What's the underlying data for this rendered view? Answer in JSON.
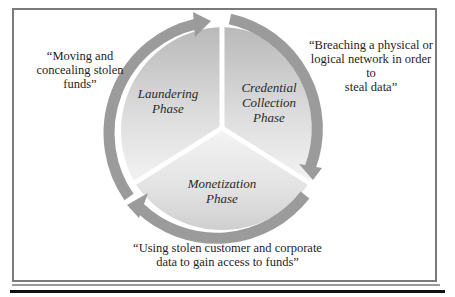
{
  "diagram": {
    "type": "cycle",
    "phases": [
      {
        "label": "Laundering Phase",
        "line1": "Laundering",
        "line2": "Phase",
        "description": "“Moving and concealing stolen funds”",
        "desc_lines": [
          "“Moving and",
          "concealing stolen",
          "funds”"
        ]
      },
      {
        "label": "Credential Collection Phase",
        "line1": "Credential",
        "line2": "Collection",
        "line3": "Phase",
        "description": "“Breaching a physical or logical network in order to steal data”",
        "desc_lines": [
          "“Breaching a physical or",
          "logical network in order to",
          "steal data”"
        ]
      },
      {
        "label": "Monetization Phase",
        "line1": "Monetization",
        "line2": "Phase",
        "description": "“Using stolen customer and corporate data to gain access to funds”",
        "desc_lines": [
          "“Using stolen customer and corporate",
          "data to gain access to funds”"
        ]
      }
    ],
    "flow": [
      "Laundering Phase",
      "Credential Collection Phase",
      "Monetization Phase",
      "Laundering Phase"
    ],
    "colors": {
      "arrow": "#9b9b9b",
      "segment_top": "#bdbdbd",
      "segment_bottom": "#f1f1f1",
      "border": "#7a7a7a",
      "divider": "#ffffff"
    }
  }
}
